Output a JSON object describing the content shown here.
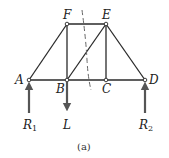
{
  "diagram": {
    "type": "truss",
    "caption": "(a)",
    "nodes": [
      {
        "id": "A",
        "label": "A",
        "x": 29,
        "y": 80
      },
      {
        "id": "B",
        "label": "B",
        "x": 67,
        "y": 80
      },
      {
        "id": "C",
        "label": "C",
        "x": 106,
        "y": 80
      },
      {
        "id": "D",
        "label": "D",
        "x": 145,
        "y": 80
      },
      {
        "id": "E",
        "label": "E",
        "x": 106,
        "y": 24
      },
      {
        "id": "F",
        "label": "F",
        "x": 67,
        "y": 24
      }
    ],
    "members": [
      [
        "A",
        "B"
      ],
      [
        "B",
        "C"
      ],
      [
        "C",
        "D"
      ],
      [
        "F",
        "E"
      ],
      [
        "A",
        "F"
      ],
      [
        "F",
        "B"
      ],
      [
        "B",
        "E"
      ],
      [
        "E",
        "C"
      ],
      [
        "E",
        "D"
      ]
    ],
    "loads": [
      {
        "id": "R1",
        "label": "R",
        "subscript": "1",
        "at": "A",
        "direction": "up"
      },
      {
        "id": "L",
        "label": "L",
        "subscript": "",
        "at": "B",
        "direction": "down"
      },
      {
        "id": "R2",
        "label": "R",
        "subscript": "2",
        "at": "D",
        "direction": "up"
      }
    ],
    "section_cut": {
      "style": "dashed",
      "cuts": [
        "F-E",
        "B-E",
        "B-C"
      ]
    },
    "colors": {
      "line": "#2a2a2a",
      "arrow": "#555555",
      "dash": "#555555"
    }
  }
}
